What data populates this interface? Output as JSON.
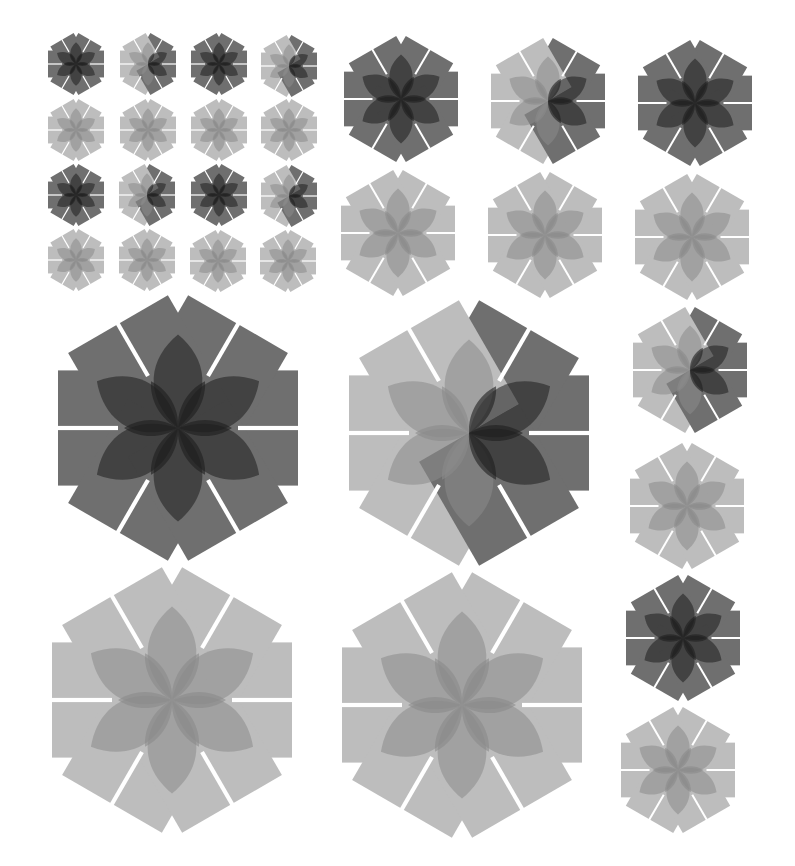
{
  "figure": {
    "width": 795,
    "height": 866,
    "background": "#ffffff",
    "gap_color": "#ffffff"
  },
  "palette": {
    "dark_bar": "#6f6f6f",
    "light_bar": "#bdbdbd",
    "dark_petal": "#1e1e1e",
    "light_petal": "#8a8a8a",
    "bar_opacity": 1,
    "petal_opacity": 0.55
  },
  "rosettes": [
    {
      "id": "small-r1c1",
      "cx": 76,
      "cy": 64,
      "r": 28,
      "shade": "dark"
    },
    {
      "id": "small-r1c2",
      "cx": 148,
      "cy": 64,
      "r": 28,
      "shade": "half"
    },
    {
      "id": "small-r1c3",
      "cx": 219,
      "cy": 64,
      "r": 28,
      "shade": "dark"
    },
    {
      "id": "small-r1c4",
      "cx": 289,
      "cy": 66,
      "r": 28,
      "shade": "half"
    },
    {
      "id": "small-r2c1",
      "cx": 76,
      "cy": 130,
      "r": 28,
      "shade": "light"
    },
    {
      "id": "small-r2c2",
      "cx": 148,
      "cy": 130,
      "r": 28,
      "shade": "light"
    },
    {
      "id": "small-r2c3",
      "cx": 219,
      "cy": 130,
      "r": 28,
      "shade": "light"
    },
    {
      "id": "small-r2c4",
      "cx": 289,
      "cy": 130,
      "r": 28,
      "shade": "light"
    },
    {
      "id": "small-r3c1",
      "cx": 76,
      "cy": 195,
      "r": 28,
      "shade": "dark"
    },
    {
      "id": "small-r3c2",
      "cx": 147,
      "cy": 195,
      "r": 28,
      "shade": "half"
    },
    {
      "id": "small-r3c3",
      "cx": 219,
      "cy": 195,
      "r": 28,
      "shade": "dark"
    },
    {
      "id": "small-r3c4",
      "cx": 289,
      "cy": 196,
      "r": 28,
      "shade": "half"
    },
    {
      "id": "small-r4c1",
      "cx": 76,
      "cy": 260,
      "r": 28,
      "shade": "light"
    },
    {
      "id": "small-r4c2",
      "cx": 147,
      "cy": 260,
      "r": 28,
      "shade": "light"
    },
    {
      "id": "small-r4c3",
      "cx": 218,
      "cy": 261,
      "r": 28,
      "shade": "light"
    },
    {
      "id": "small-r4c4",
      "cx": 288,
      "cy": 261,
      "r": 28,
      "shade": "light"
    },
    {
      "id": "medium-r1c1",
      "cx": 401,
      "cy": 99,
      "r": 57,
      "shade": "dark"
    },
    {
      "id": "medium-r1c2",
      "cx": 548,
      "cy": 101,
      "r": 57,
      "shade": "half"
    },
    {
      "id": "medium-r1c3",
      "cx": 695,
      "cy": 103,
      "r": 57,
      "shade": "dark"
    },
    {
      "id": "medium-r2c1",
      "cx": 398,
      "cy": 233,
      "r": 57,
      "shade": "light"
    },
    {
      "id": "medium-r2c2",
      "cx": 545,
      "cy": 235,
      "r": 57,
      "shade": "light"
    },
    {
      "id": "medium-r2c3",
      "cx": 692,
      "cy": 237,
      "r": 57,
      "shade": "light"
    },
    {
      "id": "large-r1c1",
      "cx": 178,
      "cy": 428,
      "r": 120,
      "shade": "dark"
    },
    {
      "id": "large-r1c2",
      "cx": 469,
      "cy": 433,
      "r": 120,
      "shade": "half"
    },
    {
      "id": "large-r2c1",
      "cx": 172,
      "cy": 700,
      "r": 120,
      "shade": "light"
    },
    {
      "id": "large-r2c2",
      "cx": 462,
      "cy": 705,
      "r": 120,
      "shade": "light"
    },
    {
      "id": "side-1",
      "cx": 690,
      "cy": 370,
      "r": 57,
      "shade": "half"
    },
    {
      "id": "side-2",
      "cx": 687,
      "cy": 506,
      "r": 57,
      "shade": "light"
    },
    {
      "id": "side-3",
      "cx": 683,
      "cy": 638,
      "r": 57,
      "shade": "dark"
    },
    {
      "id": "side-4",
      "cx": 678,
      "cy": 770,
      "r": 57,
      "shade": "light"
    }
  ]
}
